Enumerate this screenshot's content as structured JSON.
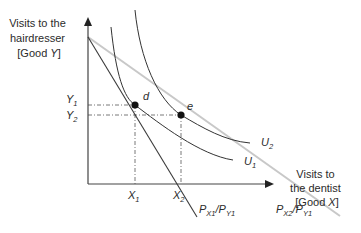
{
  "diagram": {
    "type": "indifference-curve-budget-line",
    "y_axis_label": [
      "Visits to the",
      "hairdresser",
      "[Good ",
      "Y",
      "]"
    ],
    "x_axis_label": [
      "Visits to",
      "the dentist",
      "[Good ",
      "X",
      "]"
    ],
    "y_ticks": [
      {
        "main": "Y",
        "sub": "1"
      },
      {
        "main": "Y",
        "sub": "2"
      }
    ],
    "x_ticks": [
      {
        "main": "X",
        "sub": "1"
      },
      {
        "main": "X",
        "sub": "2"
      }
    ],
    "points": [
      {
        "label": "d"
      },
      {
        "label": "e"
      }
    ],
    "curves": [
      {
        "main": "U",
        "sub": "1"
      },
      {
        "main": "U",
        "sub": "2"
      }
    ],
    "budget_lines": [
      {
        "p1": "P",
        "s1": "X1",
        "slash": "/",
        "p2": "P",
        "s2": "Y1"
      },
      {
        "p1": "P",
        "s1": "X2",
        "slash": "/",
        "p2": "P",
        "s2": "Y1"
      }
    ],
    "colors": {
      "axis": "#444444",
      "line": "#3a3a3a",
      "light_line": "#c8c8c8",
      "point": "#111111",
      "guide": "#555555"
    }
  }
}
